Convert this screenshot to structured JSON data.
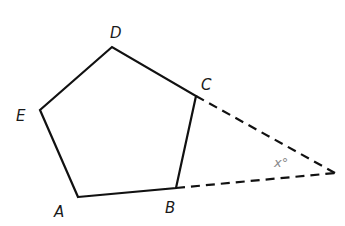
{
  "diagram": {
    "vertices": {
      "A": {
        "label": "A",
        "x": 78,
        "y": 197
      },
      "B": {
        "label": "B",
        "x": 176,
        "y": 188
      },
      "C": {
        "label": "C",
        "x": 196,
        "y": 96
      },
      "D": {
        "label": "D",
        "x": 112,
        "y": 47
      },
      "E": {
        "label": "E",
        "x": 40,
        "y": 110
      }
    },
    "apex": {
      "x": 335,
      "y": 173
    },
    "angle_label": "x°",
    "colors": {
      "lines": "#111111",
      "labels": "#1a1a1a",
      "angle_label": "#8a8a8a"
    }
  }
}
